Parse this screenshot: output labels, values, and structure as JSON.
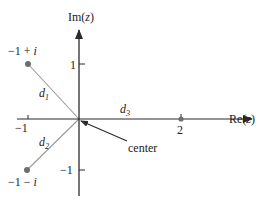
{
  "diagram": {
    "axes": {
      "x_label": "Re(z)",
      "x_label_prefix": "Re(",
      "x_label_var": "z",
      "x_label_suffix": ")",
      "y_label": "Im(z)",
      "y_label_prefix": "Im(",
      "y_label_var": "z",
      "y_label_suffix": ")",
      "x_ticks": [
        "-1",
        "2"
      ],
      "y_ticks": [
        "1",
        "-1"
      ]
    },
    "tick_labels": {
      "x_neg1": "−1",
      "x_2": "2",
      "y_1": "1",
      "y_neg1": "−1"
    },
    "points": [
      {
        "id": "p1",
        "label": "−1 + ",
        "label_var": "i",
        "re": -1,
        "im": 1
      },
      {
        "id": "p2",
        "label": "−1 − ",
        "label_var": "i",
        "re": -1,
        "im": -1
      },
      {
        "id": "p3",
        "label": "2",
        "re": 2,
        "im": 0
      }
    ],
    "segments": [
      {
        "name": "d",
        "sub": "1",
        "from": "center",
        "to": "p1"
      },
      {
        "name": "d",
        "sub": "2",
        "from": "center",
        "to": "p2"
      },
      {
        "name": "d",
        "sub": "3",
        "from": "center",
        "to": "p3"
      }
    ],
    "annotation": {
      "text": "center",
      "points_to": "origin"
    },
    "colors": {
      "axis": "#2b2b2b",
      "segment": "#9a9a9a",
      "point": "#6e6e6e",
      "text": "#222222"
    }
  }
}
